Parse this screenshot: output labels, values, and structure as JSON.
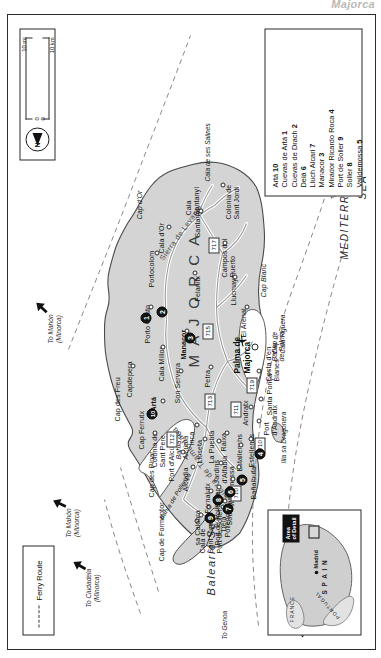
{
  "page": {
    "title": "Majorca"
  },
  "ferry_legend": {
    "label": "Ferry Route"
  },
  "scale": {
    "miles_label": "10 mi",
    "km_label": "10 km",
    "zero_mi": "0",
    "zero_km": "0",
    "north_label": "N"
  },
  "inset": {
    "countries": [
      "FRANCE",
      "S P A I N",
      "PORTUGAL"
    ],
    "capital": "Madrid",
    "area_of_detail": "Area\nof Detail"
  },
  "island_name": "M A J O R C A",
  "seas": [
    {
      "name": "Balearic  Sea"
    },
    {
      "name": "MEDITERRANEAN"
    },
    {
      "name": "SEA"
    }
  ],
  "bays": [
    {
      "name": "Bahía de\nAlcúdia"
    },
    {
      "name": "Bahía\nde Palma"
    },
    {
      "name": "Bahía de Pollença"
    }
  ],
  "mountain_ranges": [
    {
      "name": "Sierra de Tramuntana"
    },
    {
      "name": "Sierra de Levante"
    }
  ],
  "ferry_routes": [
    {
      "label": "To Mahón\n(Minorca)"
    },
    {
      "label": "To Ciudadela\n(Minorca)"
    },
    {
      "label": "To Mahón\n(Minorca)"
    },
    {
      "label": "To Genoa"
    },
    {
      "label": "To Barcelona"
    },
    {
      "label": "To Valencia"
    },
    {
      "label": "To Ibiza"
    }
  ],
  "capital_city": {
    "name": "Palma de\nMajorca",
    "airport_icon": "airplane-icon"
  },
  "places": [
    {
      "name": "Cap de Formentor"
    },
    {
      "name": "Cap des Pinar"
    },
    {
      "name": "Cap des Freu"
    },
    {
      "name": "Cap Ferrutx"
    },
    {
      "name": "Cap d'Or"
    },
    {
      "name": "Cap Blanc"
    },
    {
      "name": "Cap de\nCala Figuera"
    },
    {
      "name": "Cala de\nSant Vicenç"
    },
    {
      "name": "Port de Pollença"
    },
    {
      "name": "Pollença"
    },
    {
      "name": "Alcúdia"
    },
    {
      "name": "Port d'Alcúdia"
    },
    {
      "name": "La Puebla"
    },
    {
      "name": "Capdepera"
    },
    {
      "name": "Cala Millor"
    },
    {
      "name": "Colonia de\nSant Pere"
    },
    {
      "name": "Artá"
    },
    {
      "name": "Son Servera"
    },
    {
      "name": "Petra"
    },
    {
      "name": "Manacor"
    },
    {
      "name": "Porto Cristo"
    },
    {
      "name": "Portocolom"
    },
    {
      "name": "Cala d'Or"
    },
    {
      "name": "Felanitx"
    },
    {
      "name": "Santanyí"
    },
    {
      "name": "Cala\nSantanyí"
    },
    {
      "name": "Colonia de\nSant Jordi"
    },
    {
      "name": "Cala de ses Salines"
    },
    {
      "name": "Campos del\nPuerto"
    },
    {
      "name": "Llucmayor"
    },
    {
      "name": "El Arenal"
    },
    {
      "name": "Costa d'en\nBlanes"
    },
    {
      "name": "Santa Ponça"
    },
    {
      "name": "Port\nd'Andratx"
    },
    {
      "name": "Andratx"
    },
    {
      "name": "Estellenes"
    },
    {
      "name": "Estallenchs"
    },
    {
      "name": "Bañalbufar"
    },
    {
      "name": "Valldemossa"
    },
    {
      "name": "Son Marroig"
    },
    {
      "name": "Deià"
    },
    {
      "name": "Port de Soller"
    },
    {
      "name": "Fornalutx"
    },
    {
      "name": "Soller"
    },
    {
      "name": "Jardins\nd'Alfabia"
    },
    {
      "name": "Raixa"
    },
    {
      "name": "Lloseta"
    },
    {
      "name": "Inca"
    },
    {
      "name": "sa Calobra"
    },
    {
      "name": "Illa sa Dragonera"
    }
  ],
  "roads": [
    {
      "number": "710"
    },
    {
      "number": "711"
    },
    {
      "number": "712"
    },
    {
      "number": "713"
    },
    {
      "number": "715"
    },
    {
      "number": "717"
    },
    {
      "number": "719"
    },
    {
      "number": "710"
    }
  ],
  "markers": [
    {
      "num": "1"
    },
    {
      "num": "2"
    },
    {
      "num": "3"
    },
    {
      "num": "4"
    },
    {
      "num": "5"
    },
    {
      "num": "6"
    },
    {
      "num": "7"
    },
    {
      "num": "8"
    },
    {
      "num": "9"
    },
    {
      "num": "10"
    }
  ],
  "key_items": [
    {
      "name": "Artá",
      "num": "10"
    },
    {
      "name": "Cuevas de Artá",
      "num": "1"
    },
    {
      "name": "Cuevas de Drach",
      "num": "2"
    },
    {
      "name": "Deià",
      "num": "6"
    },
    {
      "name": "Lluch Alcari",
      "num": "7"
    },
    {
      "name": "Manacor",
      "num": "3"
    },
    {
      "name": "Mirador Ricardo Roca",
      "num": "4"
    },
    {
      "name": "Port de Soller",
      "num": "9"
    },
    {
      "name": "Soller",
      "num": "8"
    },
    {
      "name": "Valldemossa",
      "num": "5"
    }
  ],
  "colors": {
    "land": "#d3d3d3",
    "outline": "#3a3a3a",
    "road": "#ffffff",
    "marker": "#141414"
  }
}
